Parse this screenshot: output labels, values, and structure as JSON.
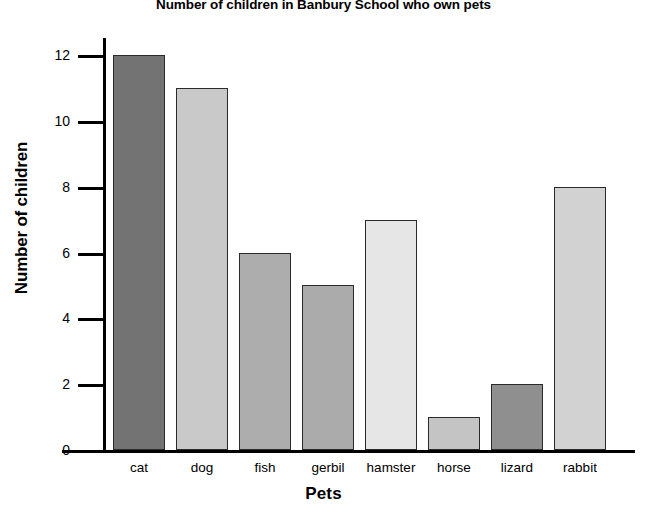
{
  "chart_data": {
    "type": "bar",
    "title": "Number of children in Banbury School who own pets",
    "xlabel": "Pets",
    "ylabel": "Number of children",
    "categories": [
      "cat",
      "dog",
      "fish",
      "gerbil",
      "hamster",
      "horse",
      "lizard",
      "rabbit"
    ],
    "values": [
      12,
      11,
      6,
      5,
      7,
      1,
      2,
      8
    ],
    "bar_colors": [
      "#737373",
      "#c9c9c9",
      "#adadad",
      "#ababab",
      "#e6e6e6",
      "#c4c4c4",
      "#8f8f8f",
      "#d2d2d2"
    ],
    "bar_border_color": "#2b2b2b",
    "ylim": [
      0,
      13
    ],
    "ytick_labels": [
      "0",
      "2",
      "4",
      "6",
      "8",
      "10",
      "12"
    ],
    "ytick_values": [
      0,
      2,
      4,
      6,
      8,
      10,
      12
    ],
    "grid": false,
    "legend": null,
    "axis_color": "#000000",
    "background": "#ffffff"
  }
}
